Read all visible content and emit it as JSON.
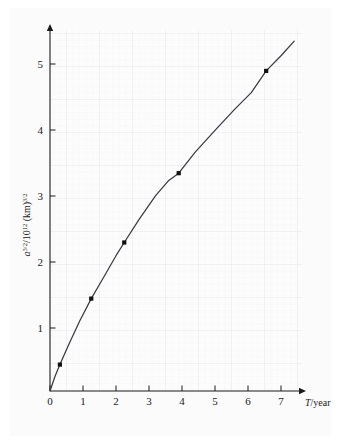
{
  "figure": {
    "background_color": "#ffffff",
    "page_tint_color": "#fbfbfb",
    "grid_minor_color": "#ededf0",
    "grid_major_color": "#e0e0e6",
    "axis_color": "#1a1a1a",
    "curve_color": "#3a3a42",
    "marker_color": "#111111"
  },
  "axes": {
    "x": {
      "label_italic": "T",
      "label_rest": "/year",
      "label_full": "T/year",
      "ticks": [
        "0",
        "1",
        "2",
        "3",
        "4",
        "5",
        "6",
        "7"
      ],
      "tick_values": [
        0,
        1,
        2,
        3,
        4,
        5,
        6,
        7
      ],
      "range": [
        0,
        7.6
      ],
      "arrow": true
    },
    "y": {
      "label_full": "a3/2/1012 (km)3/2",
      "label_parts": {
        "var": "a",
        "var_exp": "3/2",
        "divider": "/10",
        "divider_exp": "12",
        "unit": " (km)",
        "unit_exp": "3/2"
      },
      "ticks": [
        "1",
        "2",
        "3",
        "4",
        "5"
      ],
      "tick_values": [
        1,
        2,
        3,
        4,
        5
      ],
      "range": [
        0,
        5.6
      ],
      "arrow": true
    }
  },
  "chart_data": {
    "type": "scatter",
    "title": "",
    "xlabel": "T/year",
    "ylabel": "a^3/2 / 10^12 (km)^3/2",
    "xlim": [
      0,
      7.6
    ],
    "ylim": [
      0,
      5.6
    ],
    "grid": true,
    "grid_style": "graph-paper minor and major",
    "legend": "none",
    "x": [
      0.3,
      1.25,
      2.25,
      3.9,
      6.55
    ],
    "y": [
      0.4,
      1.4,
      2.25,
      3.3,
      4.85
    ],
    "points": [
      {
        "x": 0.3,
        "y": 0.4
      },
      {
        "x": 1.25,
        "y": 1.4
      },
      {
        "x": 2.25,
        "y": 2.25
      },
      {
        "x": 3.9,
        "y": 3.3
      },
      {
        "x": 6.55,
        "y": 4.85
      }
    ],
    "series": [
      {
        "name": "fitted curve",
        "type": "line",
        "note": "smooth monotonic curve through origin and the five data points, extending to about (7.4, 5.3)",
        "x": [
          0.0,
          0.15,
          0.3,
          0.6,
          0.9,
          1.25,
          1.6,
          2.0,
          2.25,
          2.7,
          3.2,
          3.6,
          3.9,
          4.4,
          5.0,
          5.6,
          6.1,
          6.55,
          7.0,
          7.4
        ],
        "y": [
          0.0,
          0.22,
          0.4,
          0.74,
          1.06,
          1.4,
          1.7,
          2.05,
          2.25,
          2.6,
          2.96,
          3.19,
          3.3,
          3.62,
          3.95,
          4.27,
          4.52,
          4.85,
          5.08,
          5.3
        ]
      }
    ]
  }
}
